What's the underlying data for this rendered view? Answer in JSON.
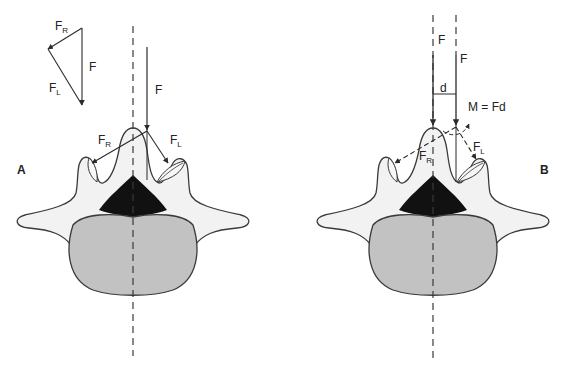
{
  "figure": {
    "colors": {
      "background": "#ffffff",
      "outline": "#3a3a3a",
      "arch_fill": "#f2f2f2",
      "body_fill": "#c2c2c2",
      "canal_fill": "#111111",
      "vector": "#2a2a2a"
    },
    "panel_a": {
      "label": "A",
      "force_triangle": {
        "fr_label": "F",
        "fr_sub": "R",
        "f_label": "F",
        "fl_label": "F",
        "fl_sub": "L"
      },
      "applied_force_label": "F",
      "fr_label": "F",
      "fr_sub": "R",
      "fl_label": "F",
      "fl_sub": "L"
    },
    "panel_b": {
      "label": "B",
      "force_left_label": "F",
      "force_right_label": "F",
      "distance_label": "d",
      "moment_label": "M = Fd",
      "fr_label": "F",
      "fr_sub": "R",
      "fl_label": "F",
      "fl_sub": "L"
    }
  }
}
